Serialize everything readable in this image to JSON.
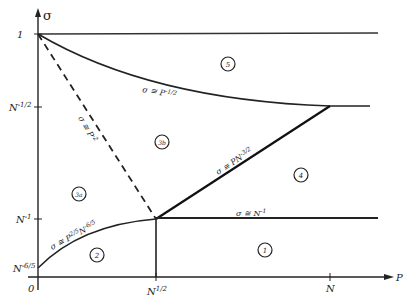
{
  "diagram": {
    "axes": {
      "y_label": "σ",
      "x_label": "P",
      "origin_label": "0",
      "y_ticks": [
        {
          "label": "1",
          "y": 34
        },
        {
          "label": "N",
          "sup": "-1/2",
          "y": 107
        },
        {
          "label": "N",
          "sup": "-1",
          "y": 219
        },
        {
          "label": "N",
          "sup": "-6/5",
          "y": 268
        }
      ],
      "x_ticks": [
        {
          "label": "N",
          "sup": "1/2",
          "x": 156
        },
        {
          "label": "N",
          "sup": "",
          "x": 330
        }
      ]
    },
    "curve_labels": {
      "p_minus_half": {
        "main": "σ ≅ P",
        "sup": "-1/2"
      },
      "p_minus_two": {
        "main": "σ ≅ P",
        "sup": "-2"
      },
      "pn_minus_three_half": {
        "main": "σ ≅ PN",
        "sup": "-3/2"
      },
      "n_minus_one": {
        "main": "σ ≅ N",
        "sup": "-1"
      },
      "p_two_fifths": {
        "main": "σ ≅ P",
        "sup": "2/5",
        "main2": "N",
        "sup2": "-6/5"
      }
    },
    "regions": [
      {
        "id": "1",
        "label": "1"
      },
      {
        "id": "2",
        "label": "2"
      },
      {
        "id": "3a",
        "label": "3a"
      },
      {
        "id": "3b",
        "label": "3b"
      },
      {
        "id": "4",
        "label": "4"
      },
      {
        "id": "5",
        "label": "5"
      }
    ],
    "colors": {
      "ink": "#222222",
      "background": "#ffffff"
    }
  }
}
